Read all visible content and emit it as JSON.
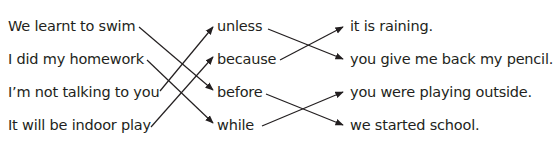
{
  "exercise": {
    "left_column": [
      {
        "text": "We learnt to swim",
        "y": 17
      },
      {
        "text": "I did my homework",
        "y": 50
      },
      {
        "text": "I’m not talking to you",
        "y": 83
      },
      {
        "text": "It will be indoor play",
        "y": 116
      }
    ],
    "middle_column": [
      {
        "text": "unless",
        "y": 17
      },
      {
        "text": "because",
        "y": 50
      },
      {
        "text": "before",
        "y": 83
      },
      {
        "text": "while",
        "y": 116
      }
    ],
    "right_column": [
      {
        "text": "it is raining.",
        "y": 17
      },
      {
        "text": "you give me back my pencil.",
        "y": 50
      },
      {
        "text": "you were playing outside.",
        "y": 83
      },
      {
        "text": "we started school.",
        "y": 116
      }
    ],
    "matches_left_to_middle": [
      {
        "from": "We learnt to swim",
        "to": "before"
      },
      {
        "from": "I did my homework",
        "to": "while"
      },
      {
        "from": "I’m not talking to you",
        "to": "unless"
      },
      {
        "from": "It will be indoor play",
        "to": "because"
      }
    ],
    "matches_middle_to_right": [
      {
        "from": "unless",
        "to": "you give me back my pencil."
      },
      {
        "from": "because",
        "to": "it is raining."
      },
      {
        "from": "before",
        "to": "we started school."
      },
      {
        "from": "while",
        "to": "you were playing outside."
      }
    ],
    "line_color": "#231f20"
  }
}
